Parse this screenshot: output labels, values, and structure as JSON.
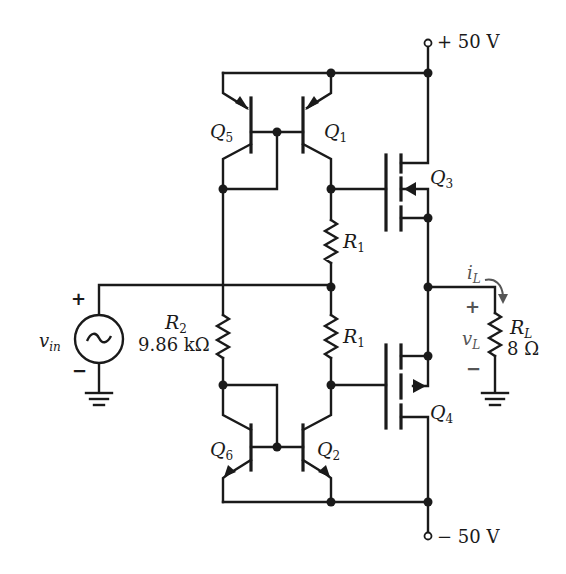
{
  "diagram": {
    "type": "circuit-schematic",
    "supplies": {
      "positive": {
        "label": "+ 50 V"
      },
      "negative": {
        "label": "− 50 V"
      }
    },
    "source": {
      "name_main": "v",
      "name_sub": "in",
      "plus": "+",
      "minus": "−",
      "symbol": "~"
    },
    "resistors": {
      "r2": {
        "name_main": "R",
        "name_sub": "2",
        "value": "9.86 kΩ"
      },
      "r1_upper": {
        "name_main": "R",
        "name_sub": "1"
      },
      "r1_lower": {
        "name_main": "R",
        "name_sub": "1"
      },
      "rl": {
        "name_main": "R",
        "name_sub": "L",
        "value": "8 Ω"
      }
    },
    "transistors": {
      "q1": {
        "main": "Q",
        "sub": "1",
        "kind": "pnp"
      },
      "q2": {
        "main": "Q",
        "sub": "2",
        "kind": "npn"
      },
      "q3": {
        "main": "Q",
        "sub": "3",
        "kind": "n-mosfet"
      },
      "q4": {
        "main": "Q",
        "sub": "4",
        "kind": "p-mosfet"
      },
      "q5": {
        "main": "Q",
        "sub": "5",
        "kind": "pnp"
      },
      "q6": {
        "main": "Q",
        "sub": "6",
        "kind": "npn"
      }
    },
    "load": {
      "current_main": "i",
      "current_sub": "L",
      "voltage_main": "v",
      "voltage_sub": "L",
      "plus": "+",
      "minus": "−"
    },
    "colors": {
      "wire": "#1a1a1a",
      "annotation": "#555555"
    }
  }
}
